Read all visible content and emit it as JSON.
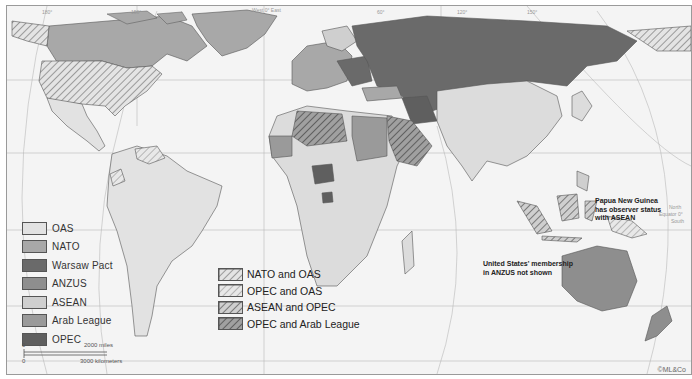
{
  "map": {
    "title_hidden": "",
    "top_labels": {
      "west_east": "West 0° East",
      "deg_180_left": "180°",
      "deg_150": "150°",
      "deg_60": "60°",
      "deg_120": "120°",
      "deg_150_right": "150°"
    },
    "side_labels": {
      "north": "North",
      "equator": "Equator 0°",
      "south": "South",
      "lat_left_30": "30°",
      "lat_left_60": "60°"
    },
    "bottom_labels": {
      "deg_120_left": "120°",
      "deg_60": "60°",
      "deg_0": "0°",
      "deg_60e": "60°",
      "deg_120e": "120°",
      "deg_180": "180°"
    }
  },
  "legend": {
    "items": [
      {
        "label": "OAS",
        "color": "#e2e2e2",
        "pattern": "solid"
      },
      {
        "label": "NATO",
        "color": "#a8a8a8",
        "pattern": "solid"
      },
      {
        "label": "Warsaw Pact",
        "color": "#6a6a6a",
        "pattern": "solid"
      },
      {
        "label": "ANZUS",
        "color": "#8e8e8e",
        "pattern": "solid"
      },
      {
        "label": "ASEAN",
        "color": "#cfcfcf",
        "pattern": "solid"
      },
      {
        "label": "Arab League",
        "color": "#9a9a9a",
        "pattern": "solid"
      },
      {
        "label": "OPEC",
        "color": "#5f5f5f",
        "pattern": "solid"
      }
    ]
  },
  "legend_combined": {
    "items": [
      {
        "label": "NATO and OAS",
        "pattern": "hatch-light"
      },
      {
        "label": "OPEC and OAS",
        "pattern": "hatch-pale"
      },
      {
        "label": "ASEAN and OPEC",
        "pattern": "hatch-mid"
      },
      {
        "label": "OPEC and Arab League",
        "pattern": "hatch-dark"
      }
    ]
  },
  "notes": {
    "png": [
      "Papua New Guinea",
      "has observer status",
      "with ASEAN"
    ],
    "us_anzus": [
      "United States' membership",
      "in ANZUS not shown"
    ]
  },
  "scale": {
    "miles": "2000 miles",
    "km": "3000 kilometers",
    "zero1": "0",
    "zero2": "0"
  },
  "copyright": "©ML&Co"
}
